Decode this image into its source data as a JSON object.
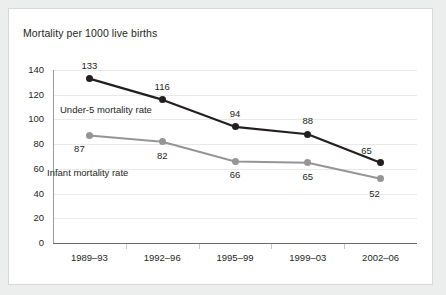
{
  "chart_data": {
    "type": "line",
    "title": "Mortality per 1000 live births",
    "xlabel": "",
    "ylabel": "",
    "categories": [
      "1989–93",
      "1992–96",
      "1995–99",
      "1999–03",
      "2002–06"
    ],
    "series": [
      {
        "name": "Under-5 mortality rate",
        "color": "#231f20",
        "values": [
          133,
          116,
          94,
          88,
          65
        ],
        "label_position": "above"
      },
      {
        "name": "Infant mortality rate",
        "color": "#959595",
        "values": [
          87,
          82,
          66,
          65,
          52
        ],
        "label_position": "below"
      }
    ],
    "ylim": [
      0,
      140
    ],
    "yticks": [
      0,
      20,
      40,
      60,
      80,
      100,
      120,
      140
    ],
    "ytick_labels": [
      "0",
      "20",
      "40",
      "60",
      "80",
      "100",
      "120",
      "140"
    ],
    "grid": true,
    "legend": "inline-annotations",
    "annotations": [
      {
        "text": "Under-5 mortality rate",
        "x": 60,
        "y": 104
      },
      {
        "text": "Infant mortality rate",
        "x": 47,
        "y": 167
      }
    ]
  },
  "value_labels": {
    "series0": [
      "133",
      "116",
      "94",
      "88",
      "65"
    ],
    "series1": [
      "87",
      "82",
      "66",
      "65",
      "52"
    ]
  }
}
